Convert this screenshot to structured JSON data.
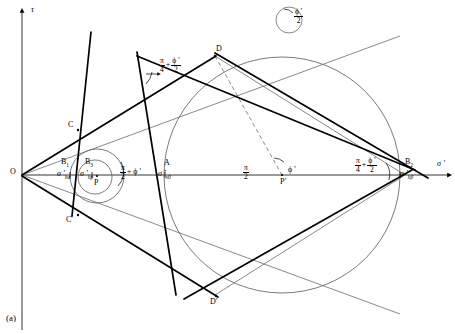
{
  "figure": {
    "caption": "(a)",
    "axes": {
      "y_label": "τ",
      "x_label": "σ '",
      "origin_label": "O"
    },
    "angles": [
      {
        "id": "top-left-wedge",
        "num": "π",
        "den": "4",
        "op": "+",
        "num2": "ϕ '",
        "den2": "2"
      },
      {
        "id": "top-right-small",
        "num": "",
        "den": "",
        "op": "",
        "num2": "ϕ '",
        "den2": "2"
      },
      {
        "id": "small-circle-center",
        "num": "π",
        "den": "2",
        "op": "+",
        "num2": "ϕ '",
        "den2": ""
      },
      {
        "id": "big-circle-center",
        "num": "π",
        "den": "2",
        "op": "",
        "num2": "ϕ '",
        "den2": ""
      },
      {
        "id": "right-wedge",
        "num": "π",
        "den": "4",
        "op": "+",
        "num2": "ϕ '",
        "den2": "2"
      }
    ],
    "points": [
      {
        "id": "O",
        "label": "O"
      },
      {
        "id": "C",
        "label": "C"
      },
      {
        "id": "Cprime",
        "label": "C'"
      },
      {
        "id": "D",
        "label": "D"
      },
      {
        "id": "Dprime",
        "label": "D'"
      },
      {
        "id": "P",
        "label": "P"
      },
      {
        "id": "Pprime",
        "label": "P'"
      },
      {
        "id": "A",
        "label": "A"
      },
      {
        "id": "B1",
        "label": "B",
        "sub": "1",
        "stress": "σ '",
        "stress_sub": "hα"
      },
      {
        "id": "B2",
        "label": "B",
        "sub": "2",
        "stress": "σ '",
        "stress_sub": "hβ"
      },
      {
        "id": "B3",
        "label": "B",
        "sub": "3",
        "stress": "σ '",
        "stress_sub": "hp"
      },
      {
        "id": "Astress",
        "label": "",
        "stress": "σ '",
        "stress_sub": "v0"
      }
    ]
  }
}
